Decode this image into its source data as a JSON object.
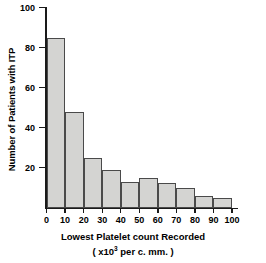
{
  "chart_data": {
    "type": "bar",
    "title": "",
    "subtitle": "",
    "xlabel": "Lowest Platelet count Recorded",
    "xlabel_sub_prefix": "( x10",
    "xlabel_sub_exponent": "3",
    "xlabel_sub_suffix": " per c. mm. )",
    "ylabel": "Number of Patients with ITP",
    "categories": [
      "0-10",
      "10-20",
      "20-30",
      "30-40",
      "40-50",
      "50-60",
      "60-70",
      "70-80",
      "80-90",
      "90-100"
    ],
    "bin_edges": [
      0,
      10,
      20,
      30,
      40,
      50,
      60,
      70,
      80,
      90,
      100
    ],
    "values": [
      85,
      48,
      25,
      19,
      13,
      15,
      12.5,
      10,
      6,
      5
    ],
    "xlim": [
      0,
      100
    ],
    "ylim": [
      0,
      100
    ],
    "x_tick_labels": [
      "0",
      "10",
      "20",
      "30",
      "40",
      "50",
      "60",
      "70",
      "80",
      "90",
      "100"
    ],
    "x_tick_values": [
      0,
      10,
      20,
      30,
      40,
      50,
      60,
      70,
      80,
      90,
      100
    ],
    "y_tick_labels": [
      "20",
      "40",
      "60",
      "80",
      "100"
    ],
    "y_tick_values": [
      20,
      40,
      60,
      80,
      100
    ],
    "grid": false,
    "legend": null,
    "bar_fill_color": "#d4d4d2",
    "bar_edge_color": "#4a4a4a",
    "axis_color": "#1a1a1a",
    "background_color": "#ffffff"
  }
}
